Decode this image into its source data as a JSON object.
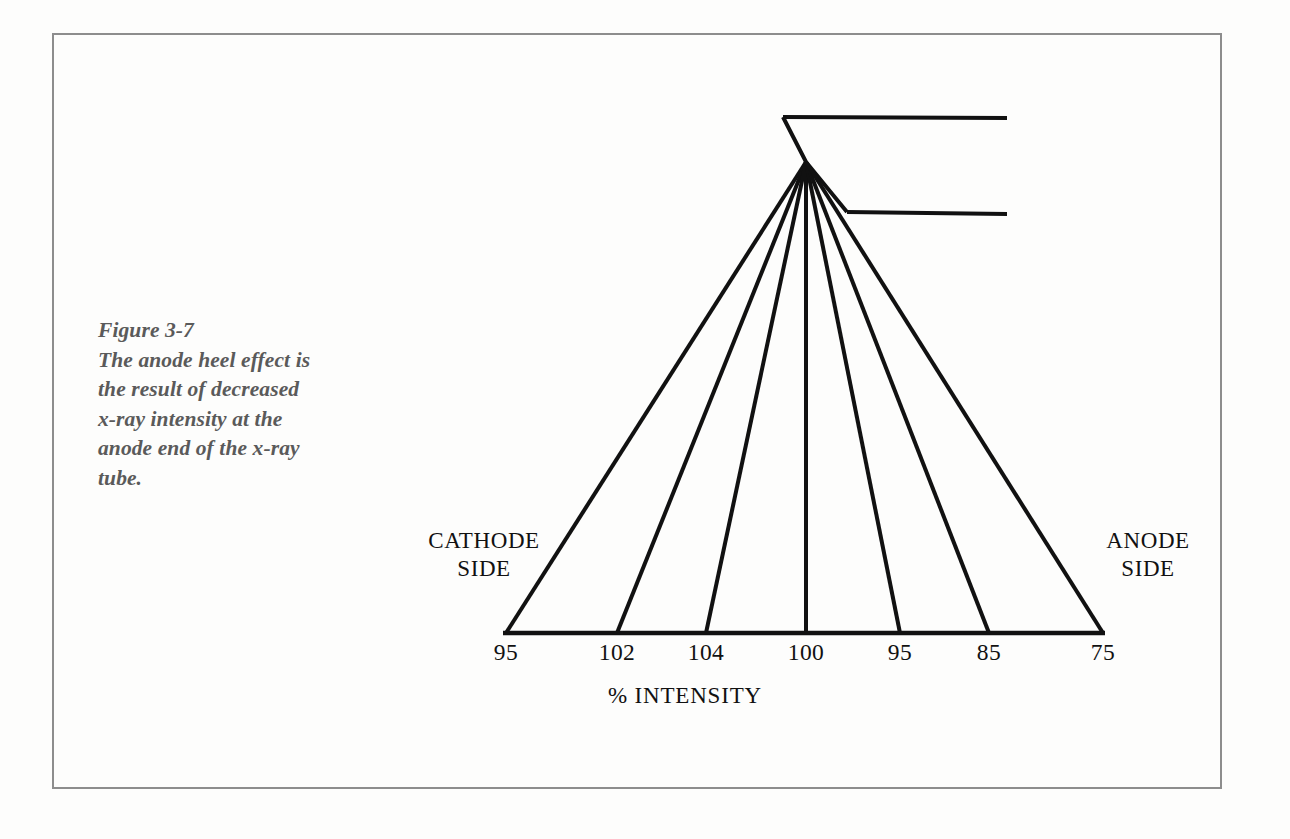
{
  "figure": {
    "number_label": "Figure 3-7",
    "caption_lines": [
      "Figure 3-7",
      "The anode heel effect is",
      "the result of decreased",
      "x-ray intensity at the",
      "anode end of the x-ray",
      "tube."
    ],
    "caption_color": "#5a5a5a",
    "line_color": "#111111",
    "frame_color": "#8d8d8d",
    "background": "#ffffff"
  },
  "labels": {
    "cathode": {
      "line1": "CATHODE",
      "line2": "SIDE"
    },
    "anode": {
      "line1": "ANODE",
      "line2": "SIDE"
    },
    "axis_title": "% INTENSITY"
  },
  "chart_data": {
    "type": "line",
    "title": "The anode heel effect",
    "xlabel": "% INTENSITY",
    "ylabel": "",
    "categories": [
      "cathode-side",
      "2",
      "3",
      "central-ray",
      "5",
      "6",
      "anode-side"
    ],
    "values": [
      95,
      102,
      104,
      100,
      95,
      85,
      75
    ],
    "tick_labels": [
      "95",
      "102",
      "104",
      "100",
      "95",
      "85",
      "75"
    ],
    "tick_x": [
      506,
      617,
      706,
      806,
      900,
      989,
      1103
    ],
    "annotations": [
      "CATHODE SIDE",
      "ANODE SIDE"
    ],
    "grid": false,
    "legend": "none",
    "focal_spot": {
      "x": 806,
      "y": 162
    },
    "baseline_y": 633,
    "anode_target": {
      "vertex_top": {
        "x": 783,
        "y": 117
      },
      "bevel_end": {
        "x": 847,
        "y": 212
      },
      "top_edge_end_x": 1007,
      "bottom_edge_end_x": 1007
    }
  }
}
